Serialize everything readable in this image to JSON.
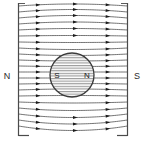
{
  "figure": {
    "width": 146,
    "height": 153,
    "background_color": "#ffffff"
  },
  "external_field": {
    "left_plate_label": "N",
    "right_plate_label": "S",
    "line_color": "#555555",
    "plate_color": "#4a4a4a"
  },
  "magnet": {
    "shape": "circle",
    "left_pole_label": "S",
    "right_pole_label": "N",
    "outline_color": "#3a3a3a",
    "hatch_color": "#8a8a8a",
    "center_x": 72,
    "center_y": 75,
    "radius": 22
  },
  "field_lines": {
    "count": 21,
    "direction": "left-to-right",
    "arrow_color": "#1a1a1a",
    "description": "Field lines run from the left N plate to the right S plate, deflected around the central sphere"
  },
  "chart_data": {
    "type": "line",
    "xlabel": "",
    "ylabel": "",
    "xlim": [
      18,
      128
    ],
    "ylim": [
      3,
      136
    ],
    "grid": false,
    "legend": "none",
    "annotations": [
      {
        "text": "N",
        "x": 6,
        "y": 78,
        "role": "left-plate-pole"
      },
      {
        "text": "S",
        "x": 135,
        "y": 78,
        "role": "right-plate-pole"
      },
      {
        "text": "S",
        "x": 58,
        "y": 78,
        "role": "magnet-left-pole"
      },
      {
        "text": "N",
        "x": 84,
        "y": 78,
        "role": "magnet-right-pole"
      }
    ],
    "series": [
      {
        "name": "plate-left",
        "x": [
          18,
          18
        ],
        "values": [
          3,
          136
        ]
      },
      {
        "name": "plate-right",
        "x": [
          128,
          128
        ],
        "values": [
          3,
          136
        ]
      },
      {
        "name": "fieldline-1",
        "y_left": 6,
        "y_right": 6,
        "y_mid": 2
      },
      {
        "name": "fieldline-2",
        "y_left": 12,
        "y_right": 12,
        "y_mid": 7
      },
      {
        "name": "fieldline-3",
        "y_left": 18,
        "y_right": 18,
        "y_mid": 13
      },
      {
        "name": "fieldline-4",
        "y_left": 24,
        "y_right": 24,
        "y_mid": 20
      },
      {
        "name": "fieldline-5",
        "y_left": 30,
        "y_right": 30,
        "y_mid": 27
      },
      {
        "name": "fieldline-6",
        "y_left": 36,
        "y_right": 36,
        "y_mid": 35
      },
      {
        "name": "fieldline-7",
        "y_left": 42,
        "y_right": 42,
        "y_mid": 43
      },
      {
        "name": "fieldline-8",
        "y_left": 48,
        "y_right": 48,
        "y_mid": 51
      },
      {
        "name": "fieldline-9",
        "y_left": 54,
        "y_right": 54,
        "y_mid": 57
      },
      {
        "name": "fieldline-10",
        "y_left": 60,
        "y_right": 60,
        "y_mid": 62
      },
      {
        "name": "fieldline-11",
        "y_left": 66,
        "y_right": 66,
        "y_mid": 67
      },
      {
        "name": "fieldline-12",
        "y_left": 72,
        "y_right": 72,
        "y_mid": 72
      },
      {
        "name": "fieldline-13",
        "y_left": 78,
        "y_right": 78,
        "y_mid": 78
      },
      {
        "name": "fieldline-14",
        "y_left": 84,
        "y_right": 84,
        "y_mid": 83
      },
      {
        "name": "fieldline-15",
        "y_left": 90,
        "y_right": 90,
        "y_mid": 88
      },
      {
        "name": "fieldline-16",
        "y_left": 96,
        "y_right": 96,
        "y_mid": 95
      },
      {
        "name": "fieldline-17",
        "y_left": 102,
        "y_right": 102,
        "y_mid": 104
      },
      {
        "name": "fieldline-18",
        "y_left": 108,
        "y_right": 108,
        "y_mid": 113
      },
      {
        "name": "fieldline-19",
        "y_left": 114,
        "y_right": 114,
        "y_mid": 121
      },
      {
        "name": "fieldline-20",
        "y_left": 120,
        "y_right": 120,
        "y_mid": 128
      },
      {
        "name": "fieldline-21",
        "y_left": 126,
        "y_right": 126,
        "y_mid": 135
      }
    ]
  }
}
